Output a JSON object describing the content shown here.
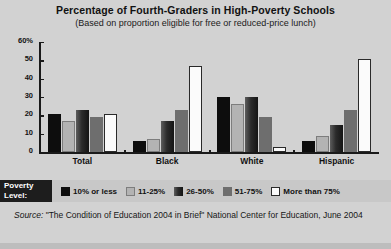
{
  "chart_data": {
    "type": "bar",
    "title": "Percentage of Fourth-Graders in High-Poverty Schools",
    "subtitle": "(Based on proportion eligible for free or reduced-price lunch)",
    "xlabel": "",
    "ylabel": "",
    "ylim": [
      0,
      60
    ],
    "yticks": [
      {
        "value": 60,
        "label": "60%"
      },
      {
        "value": 50,
        "label": "50"
      },
      {
        "value": 40,
        "label": "40"
      },
      {
        "value": 30,
        "label": "30"
      },
      {
        "value": 20,
        "label": "20"
      },
      {
        "value": 10,
        "label": "10"
      },
      {
        "value": 0,
        "label": "0"
      }
    ],
    "grid": false,
    "legend_position": "bottom",
    "categories": [
      "Total",
      "Black",
      "White",
      "Hispanic"
    ],
    "series": [
      {
        "name": "10% or less",
        "color": "#0d0d0d",
        "values": [
          21,
          6,
          30,
          6
        ]
      },
      {
        "name": "11-25%",
        "color": "#b3b3b3",
        "values": [
          17,
          7,
          26,
          9
        ]
      },
      {
        "name": "26-50%",
        "color": "#2b2b2b",
        "values": [
          23,
          17,
          30,
          15
        ]
      },
      {
        "name": "51-75%",
        "color": "#6e6e6e",
        "values": [
          19,
          23,
          19,
          23
        ]
      },
      {
        "name": "More than 75%",
        "color": "#fbfbfb",
        "values": [
          21,
          47,
          3,
          51
        ]
      }
    ]
  },
  "legend": {
    "title_line1": "Poverty",
    "title_line2": "Level:"
  },
  "source": {
    "label": "Source:",
    "text": " \"The Condition of Education 2004 in Brief\" National Center for Education, June 2004"
  }
}
